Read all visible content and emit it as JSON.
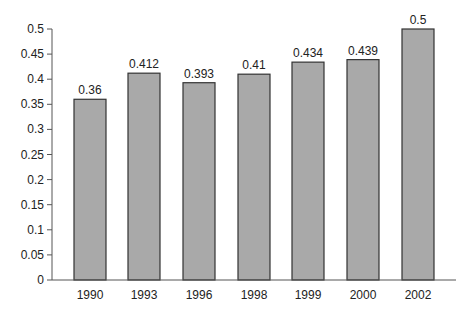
{
  "chart_data": {
    "type": "bar",
    "title": "",
    "xlabel": "",
    "ylabel": "",
    "categories": [
      "1990",
      "1993",
      "1996",
      "1998",
      "1999",
      "2000",
      "2002"
    ],
    "values": [
      0.36,
      0.412,
      0.393,
      0.41,
      0.434,
      0.439,
      0.5
    ],
    "data_labels": [
      "0.36",
      "0.412",
      "0.393",
      "0.41",
      "0.434",
      "0.439",
      "0.5"
    ],
    "ylim": [
      0,
      0.5
    ],
    "yticks": [
      "0",
      "0.05",
      "0.1",
      "0.15",
      "0.2",
      "0.25",
      "0.3",
      "0.35",
      "0.4",
      "0.45",
      "0.5"
    ],
    "grid": false,
    "legend": null,
    "colors": {
      "bar_fill": "#a9a9a9",
      "bar_stroke": "#333333",
      "axis": "#555555"
    }
  }
}
